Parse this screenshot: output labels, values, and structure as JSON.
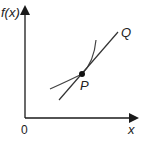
{
  "diagram": {
    "y_axis_label": "f(x)",
    "x_axis_label": "x",
    "origin_label": "0",
    "point_label": "P",
    "line_end_label": "Q",
    "stroke_color": "#1a1a1a",
    "curve_color": "#444444"
  }
}
